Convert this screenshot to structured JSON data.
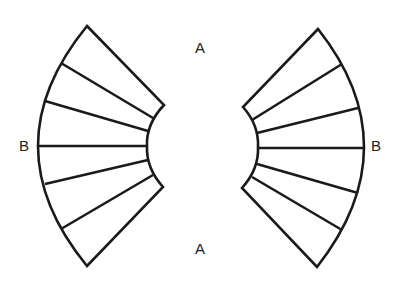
{
  "diagram": {
    "labels": {
      "top": "A",
      "bottom": "A",
      "left": "B",
      "right": "B"
    },
    "colors": {
      "stroke": "#1a1a1a",
      "background": "#ffffff",
      "text": "#222222"
    },
    "shapes": [
      {
        "name": "left-fan",
        "segments": 6,
        "radial_divisions": 5
      },
      {
        "name": "right-fan",
        "segments": 6,
        "radial_divisions": 5
      }
    ]
  }
}
